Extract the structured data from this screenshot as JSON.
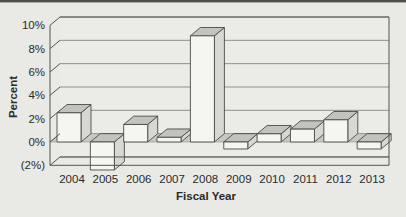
{
  "page": {
    "background": "#e9e9e6",
    "top_border_color": "#4f4f4b"
  },
  "chart_data": {
    "type": "bar",
    "projection": "3d-column",
    "title": "",
    "xlabel": "Fiscal Year",
    "ylabel": "Percent",
    "categories": [
      "2004",
      "2005",
      "2006",
      "2007",
      "2008",
      "2009",
      "2010",
      "2011",
      "2012",
      "2013"
    ],
    "values": [
      2.5,
      -2.4,
      1.5,
      0.4,
      9.1,
      -0.6,
      0.7,
      1.1,
      1.9,
      -0.6
    ],
    "ytick_labels": [
      "10%",
      "8%",
      "6%",
      "4%",
      "2%",
      "0%",
      "(2%)"
    ],
    "ytick_values": [
      10,
      8,
      6,
      4,
      2,
      0,
      -2
    ],
    "ylim": [
      -2,
      10
    ],
    "grid": true,
    "legend": false,
    "colors": {
      "bar_front": "#f5f5f2",
      "bar_top": "#c2c2be",
      "bar_side": "#d7d7d3",
      "bar_stroke": "#4a4a46",
      "wall": "#ebebe8",
      "floor_band": "#c7c7c3",
      "gridline": "#8f8f8b",
      "frame": "#55554f",
      "text": "#2b2b29"
    }
  }
}
